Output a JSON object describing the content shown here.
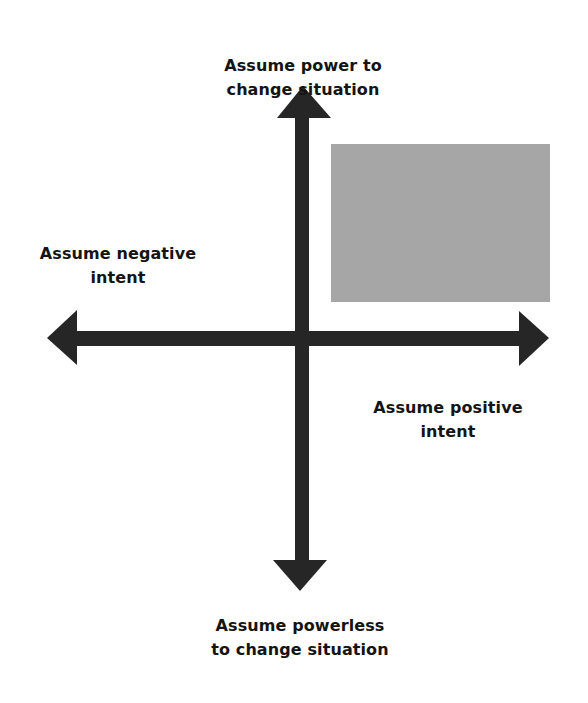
{
  "diagram": {
    "type": "quadrant",
    "axes": {
      "top": {
        "line1": "Assume power to",
        "line2": "change situation"
      },
      "left": {
        "line1": "Assume negative",
        "line2": "intent"
      },
      "right": {
        "line1": "Assume positive",
        "line2": "intent"
      },
      "bottom": {
        "line1": "Assume powerless",
        "line2": "to change situation"
      }
    },
    "highlighted_quadrant": "top-right",
    "colors": {
      "arrow": "#262626",
      "highlight": "#a6a6a6",
      "text": "#141414",
      "background": "#ffffff"
    }
  }
}
